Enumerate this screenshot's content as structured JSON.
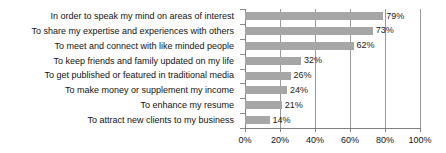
{
  "chart_data": {
    "type": "bar",
    "orientation": "horizontal",
    "title": "",
    "subtitle": "",
    "xlabel": "",
    "ylabel": "",
    "xlim": [
      0,
      100
    ],
    "xticks": [
      "0%",
      "20%",
      "40%",
      "60%",
      "80%",
      "100%"
    ],
    "xtick_values": [
      0,
      20,
      40,
      60,
      80,
      100
    ],
    "grid": "vertical",
    "legend": "none",
    "bar_color": "#a6a6a6",
    "gridline_color": "#9a9a9a",
    "text_color": "#111111",
    "categories": [
      "In order to speak my mind on areas of interest",
      "To share my expertise and experiences with others",
      "To meet and connect with like minded people",
      "To keep friends and family updated on my life",
      "To get published or featured in traditional media",
      "To make money or supplement my income",
      "To enhance my resume",
      "To attract new clients to my business"
    ],
    "values": [
      79,
      73,
      62,
      32,
      26,
      24,
      21,
      14
    ],
    "value_labels": [
      "79%",
      "73%",
      "62%",
      "32%",
      "26%",
      "24%",
      "21%",
      "14%"
    ]
  }
}
